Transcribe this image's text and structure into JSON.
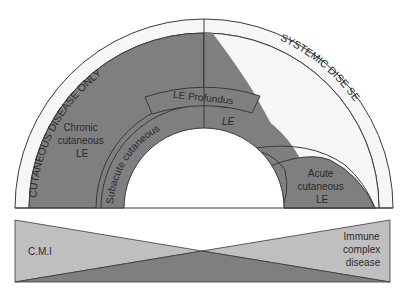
{
  "diagram": {
    "colors": {
      "dark": "#7f7f7f",
      "light": "#bfbfbf",
      "band": "#f6f6f6",
      "stroke": "#3a3a3a"
    },
    "arc_labels": {
      "left": "CUTANEOUS DISEASE ONLY",
      "right": "SYSTEMIC DISE  SE"
    },
    "regions": {
      "chronic": [
        "Chronic",
        "cutaneous",
        "LE"
      ],
      "profundus": "LE Profundus",
      "le": "LE",
      "subacute": "Subacute cutaneous",
      "acute": [
        "Acute",
        "cutaneous",
        "LE"
      ]
    },
    "spectrum": {
      "left": "C.M.I",
      "right": [
        "Immune",
        "complex",
        "disease"
      ]
    }
  }
}
